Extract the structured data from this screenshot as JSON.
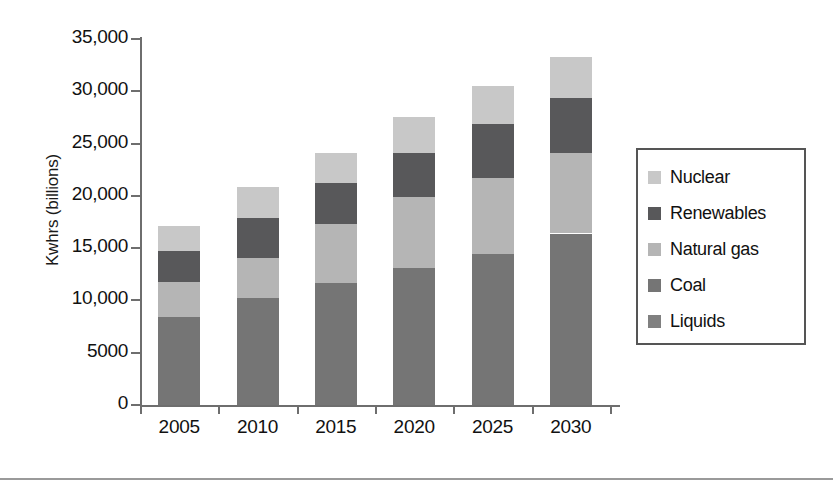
{
  "chart_data": {
    "type": "bar",
    "stacked": true,
    "title": "",
    "xlabel": "",
    "ylabel": "Kwhrs (billions)",
    "categories": [
      "2005",
      "2010",
      "2015",
      "2020",
      "2025",
      "2030"
    ],
    "ylim": [
      0,
      35000
    ],
    "yticks": [
      0,
      5000,
      10000,
      15000,
      20000,
      25000,
      30000,
      35000
    ],
    "ytick_labels": [
      "0",
      "5000",
      "10,000",
      "15,000",
      "20,000",
      "25,000",
      "30,000",
      "35,000"
    ],
    "grid": false,
    "legend_position": "right",
    "series": [
      {
        "name": "Liquids",
        "color": "#808080",
        "values": [
          0,
          0,
          0,
          0,
          0,
          0
        ]
      },
      {
        "name": "Coal",
        "color": "#757575",
        "values": [
          8400,
          10200,
          11700,
          13100,
          14400,
          16400
        ]
      },
      {
        "name": "Natural gas",
        "color": "#b5b5b5",
        "values": [
          3400,
          3900,
          5600,
          6800,
          7300,
          7700
        ]
      },
      {
        "name": "Renewables",
        "color": "#58585a",
        "values": [
          2900,
          3800,
          3900,
          4200,
          5200,
          5300
        ]
      },
      {
        "name": "Nuclear",
        "color": "#c8c8c8",
        "values": [
          2400,
          2900,
          2900,
          3400,
          3600,
          3900
        ]
      }
    ],
    "totals": [
      17100,
      20800,
      24100,
      27500,
      30500,
      33300
    ]
  },
  "legend": {
    "items": [
      {
        "label": "Nuclear",
        "color": "#c8c8c8"
      },
      {
        "label": "Renewables",
        "color": "#58585a"
      },
      {
        "label": "Natural gas",
        "color": "#b5b5b5"
      },
      {
        "label": "Coal",
        "color": "#757575"
      },
      {
        "label": "Liquids",
        "color": "#808080"
      }
    ]
  }
}
